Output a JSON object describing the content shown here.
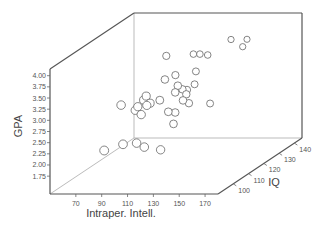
{
  "chart_data": {
    "type": "scatter",
    "subtype": "3d-scatter",
    "title": "",
    "xlabel": "Intraper. Intell.",
    "ylabel": "IQ",
    "zlabel": "GPA",
    "xlim": [
      50,
      180
    ],
    "ylim": [
      90,
      145
    ],
    "zlim": [
      1.35,
      4.15
    ],
    "x_ticks": [
      "70",
      "90",
      "110",
      "130",
      "150",
      "170"
    ],
    "y_ticks": [
      "100",
      "110",
      "120",
      "130",
      "140"
    ],
    "z_ticks": [
      "1.75",
      "2.00",
      "2.25",
      "2.50",
      "2.75",
      "3.00",
      "3.25",
      "3.50",
      "3.75",
      "4.00"
    ],
    "grid": false,
    "legend": "none",
    "marker": "open-circle",
    "points": [
      {
        "x": 131,
        "y": 140,
        "z": 3.67
      },
      {
        "x": 141,
        "y": 142,
        "z": 3.63
      },
      {
        "x": 140,
        "y": 140,
        "z": 3.51
      },
      {
        "x": 109,
        "y": 134,
        "z": 3.48
      },
      {
        "x": 114,
        "y": 134,
        "z": 3.48
      },
      {
        "x": 120,
        "y": 134,
        "z": 3.46
      },
      {
        "x": 101,
        "y": 123,
        "z": 3.69
      },
      {
        "x": 118,
        "y": 128,
        "z": 3.23
      },
      {
        "x": 107,
        "y": 117,
        "z": 3.3
      },
      {
        "x": 108,
        "y": 123,
        "z": 3.26
      },
      {
        "x": 117,
        "y": 128,
        "z": 2.94
      },
      {
        "x": 117,
        "y": 117,
        "z": 3.16
      },
      {
        "x": 117,
        "y": 120,
        "z": 3.01
      },
      {
        "x": 115,
        "y": 117,
        "z": 3.01
      },
      {
        "x": 117,
        "y": 123,
        "z": 2.93
      },
      {
        "x": 120,
        "y": 120,
        "z": 2.9
      },
      {
        "x": 121,
        "y": 117,
        "z": 2.83
      },
      {
        "x": 122,
        "y": 120,
        "z": 2.7
      },
      {
        "x": 109,
        "y": 112,
        "z": 2.95
      },
      {
        "x": 112,
        "y": 115,
        "z": 2.62
      },
      {
        "x": 115,
        "y": 117,
        "z": 2.56
      },
      {
        "x": 116,
        "y": 115,
        "z": 2.35
      },
      {
        "x": 129,
        "y": 128,
        "z": 2.51
      },
      {
        "x": 92,
        "y": 101,
        "z": 3.09
      },
      {
        "x": 97,
        "y": 106,
        "z": 2.86
      },
      {
        "x": 99,
        "y": 106,
        "z": 2.94
      },
      {
        "x": 100,
        "y": 109,
        "z": 3.02
      },
      {
        "x": 102,
        "y": 109,
        "z": 3.11
      },
      {
        "x": 106,
        "y": 106,
        "z": 2.97
      },
      {
        "x": 105,
        "y": 109,
        "z": 2.95
      },
      {
        "x": 104,
        "y": 104,
        "z": 2.81
      },
      {
        "x": 86,
        "y": 95,
        "z": 2.21
      },
      {
        "x": 97,
        "y": 98,
        "z": 2.28
      },
      {
        "x": 104,
        "y": 101,
        "z": 2.24
      },
      {
        "x": 110,
        "y": 101,
        "z": 2.15
      },
      {
        "x": 119,
        "y": 104,
        "z": 2.02
      }
    ]
  }
}
